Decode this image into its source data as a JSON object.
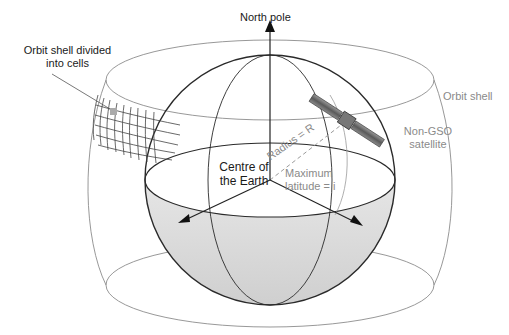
{
  "diagram": {
    "labels": {
      "north_pole": "North pole",
      "orbit_shell_cells_line1": "Orbit shell divided",
      "orbit_shell_cells_line2": "into cells",
      "orbit_shell": "Orbit shell",
      "satellite_line1": "Non-GSO",
      "satellite_line2": "satellite",
      "centre_line1": "Centre of",
      "centre_line2": "the Earth",
      "radius": "Radius = R",
      "max_lat_line1": "Maximum",
      "max_lat_line2": "latitude = i"
    },
    "colors": {
      "earth_line": "#2a2a2a",
      "shell_line": "#8c8c8c",
      "southern_hemisphere_fill": "#d9d9d9",
      "label_dark": "#1a1a1a",
      "label_grey": "#8a8a8a"
    }
  }
}
